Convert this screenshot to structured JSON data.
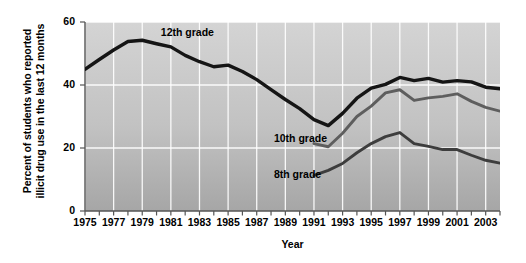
{
  "chart_data": {
    "type": "line",
    "title": "",
    "xlabel": "Year",
    "ylabel": "Percent of students who reported illicit drug use in the last 12 months",
    "ylabel_line1": "Percent of students who reported",
    "ylabel_line2": "illicit drug use in the last 12 months",
    "xlim": [
      1975,
      2004
    ],
    "ylim": [
      0,
      60
    ],
    "y_ticks": [
      0,
      20,
      40,
      60
    ],
    "x_ticks": [
      1975,
      1977,
      1979,
      1981,
      1983,
      1985,
      1987,
      1989,
      1991,
      1993,
      1995,
      1997,
      1999,
      2001,
      2003
    ],
    "grid": true,
    "grid_color": "#ffffff",
    "plot_bg_top": "#d2d2d2",
    "plot_bg_bottom": "#a8a8a8",
    "legend_position": "inline-annotations",
    "series": [
      {
        "name": "12th grade",
        "color": "#151515",
        "label_x": 1980.3,
        "label_y": 56.5,
        "x": [
          1975,
          1976,
          1977,
          1978,
          1979,
          1980,
          1981,
          1982,
          1983,
          1984,
          1985,
          1986,
          1987,
          1988,
          1989,
          1990,
          1991,
          1992,
          1993,
          1994,
          1995,
          1996,
          1997,
          1998,
          1999,
          2000,
          2001,
          2002,
          2003,
          2004
        ],
        "values": [
          45,
          48.1,
          51.1,
          53.8,
          54.2,
          53.1,
          52.1,
          49.4,
          47.4,
          45.8,
          46.3,
          44.3,
          41.7,
          38.5,
          35.4,
          32.5,
          29,
          27.1,
          31,
          35.8,
          39,
          40.2,
          42.4,
          41.4,
          42.1,
          40.9,
          41.4,
          41,
          39.3,
          38.8
        ]
      },
      {
        "name": "10th grade",
        "color": "#5e5e5e",
        "label_x": 1988.2,
        "label_y": 22.8,
        "x": [
          1991,
          1992,
          1993,
          1994,
          1995,
          1996,
          1997,
          1998,
          1999,
          2000,
          2001,
          2002,
          2003,
          2004
        ],
        "values": [
          21.4,
          20.4,
          24.7,
          30,
          33.3,
          37.5,
          38.5,
          35.1,
          35.9,
          36.4,
          37.2,
          34.8,
          32.9,
          31.7
        ]
      },
      {
        "name": "8th grade",
        "color": "#3d3d3d",
        "label_x": 1988.2,
        "label_y": 11.5,
        "x": [
          1991,
          1992,
          1993,
          1994,
          1995,
          1996,
          1997,
          1998,
          1999,
          2000,
          2001,
          2002,
          2003,
          2004
        ],
        "values": [
          11.3,
          12.9,
          15.1,
          18.5,
          21.4,
          23.6,
          24.9,
          21.4,
          20.5,
          19.5,
          19.5,
          17.7,
          16.1,
          15.2
        ]
      }
    ]
  }
}
